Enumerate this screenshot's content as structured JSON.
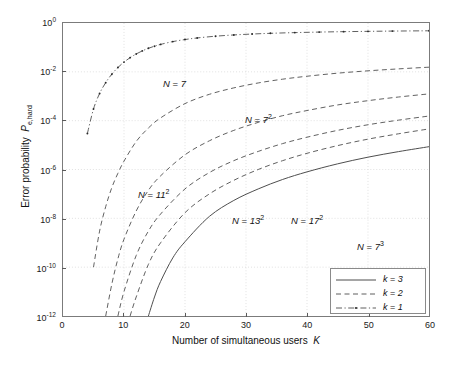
{
  "chart_data": {
    "type": "line",
    "title": "",
    "xlabel": "Number of simultaneous users  K",
    "ylabel": "Error probability  P e,hard",
    "xlim": [
      0,
      60
    ],
    "ylim": [
      1e-12,
      1
    ],
    "yscale": "log",
    "xscale": "linear",
    "grid": true,
    "xticks": [
      0,
      10,
      20,
      30,
      40,
      50,
      60
    ],
    "xtick_labels": [
      "0",
      "10",
      "20",
      "30",
      "40",
      "50",
      "60"
    ],
    "ytick_exponents": [
      0,
      -2,
      -4,
      -6,
      -8,
      -10,
      -12
    ],
    "ytick_labels": [
      "10^0",
      "10^-2",
      "10^-4",
      "10^-6",
      "10^-8",
      "10^-10",
      "10^-12"
    ],
    "legend_position": "lower right",
    "series": [
      {
        "name": "k = 1",
        "annotation": "N = 7",
        "style": "dashdot-marker",
        "x": [
          4,
          5,
          6,
          7,
          8,
          9,
          10,
          11,
          12,
          13,
          14,
          15,
          16,
          18,
          20,
          22,
          25,
          28,
          31,
          34,
          38,
          42,
          46,
          50,
          54,
          60
        ],
        "y": [
          3e-05,
          0.0003,
          0.0013,
          0.0036,
          0.008,
          0.015,
          0.025,
          0.038,
          0.054,
          0.072,
          0.092,
          0.112,
          0.133,
          0.173,
          0.21,
          0.244,
          0.288,
          0.324,
          0.353,
          0.378,
          0.404,
          0.425,
          0.442,
          0.455,
          0.467,
          0.48
        ]
      },
      {
        "name": "k = 2 (N = 7^2)",
        "annotation": "N = 7",
        "annotation_sup": "2",
        "style": "dashed",
        "x": [
          5,
          6,
          7,
          8,
          9,
          10,
          12,
          14,
          16,
          20,
          24,
          28,
          32,
          36,
          40,
          45,
          50,
          55,
          60
        ],
        "y": [
          1e-10,
          3e-09,
          3e-08,
          1.8e-07,
          7e-07,
          2.2e-06,
          1.4e-05,
          5e-05,
          0.00013,
          0.0005,
          0.0012,
          0.0022,
          0.0035,
          0.005,
          0.0066,
          0.0088,
          0.011,
          0.0132,
          0.0155
        ]
      },
      {
        "name": "k = 2 (N = 11^2)",
        "annotation": "N = 11",
        "annotation_sup": "2",
        "style": "dashed",
        "x": [
          7,
          8,
          9,
          10,
          12,
          14,
          16,
          20,
          24,
          28,
          32,
          36,
          40,
          45,
          50,
          55,
          60
        ],
        "y": [
          1e-12,
          2e-11,
          2.2e-10,
          1.4e-09,
          2e-08,
          1.4e-07,
          5.5e-07,
          4e-06,
          1.5e-05,
          4e-05,
          8.5e-05,
          0.00016,
          0.00026,
          0.00044,
          0.00066,
          0.00093,
          0.00125
        ]
      },
      {
        "name": "k = 2 (N = 13^2)",
        "annotation": "N = 13",
        "annotation_sup": "2",
        "style": "dashed",
        "x": [
          9,
          10,
          12,
          14,
          16,
          20,
          24,
          28,
          32,
          36,
          40,
          45,
          50,
          55,
          60
        ],
        "y": [
          1e-12,
          1e-11,
          3e-10,
          3e-09,
          1.5e-08,
          1.6e-07,
          7.5e-07,
          2.3e-06,
          5.5e-06,
          1.15e-05,
          2.1e-05,
          4e-05,
          6.8e-05,
          0.000105,
          0.000155
        ]
      },
      {
        "name": "k = 2 (N = 17^2)",
        "annotation": "N = 17",
        "annotation_sup": "2",
        "style": "dashed",
        "x": [
          11,
          12,
          14,
          16,
          20,
          24,
          28,
          32,
          36,
          40,
          45,
          50,
          55,
          60
        ],
        "y": [
          1e-12,
          6e-12,
          1.3e-10,
          1e-09,
          1.7e-08,
          1e-07,
          3.6e-07,
          1e-06,
          2.3e-06,
          4.6e-06,
          9.5e-06,
          1.75e-05,
          2.9e-05,
          4.6e-05
        ]
      },
      {
        "name": "k = 3 (N = 7^3)",
        "annotation": "N = 7",
        "annotation_sup": "3",
        "style": "solid",
        "x": [
          14,
          15,
          16,
          18,
          20,
          24,
          28,
          32,
          36,
          40,
          45,
          50,
          55,
          60
        ],
        "y": [
          1e-12,
          6e-12,
          2.6e-11,
          2.4e-10,
          1.1e-09,
          1.2e-08,
          5.4e-08,
          1.6e-07,
          3.9e-07,
          8e-07,
          1.7e-06,
          3.2e-06,
          5.4e-06,
          8.6e-06
        ]
      }
    ],
    "annotations": [
      {
        "text": "N = 7",
        "sup": "",
        "x_px": 163,
        "y_px": 78
      },
      {
        "text": "N = 7",
        "sup": "2",
        "x_px": 245,
        "y_px": 113
      },
      {
        "text": "N = 11",
        "sup": "2",
        "x_px": 138,
        "y_px": 188
      },
      {
        "text": "N = 13",
        "sup": "2",
        "x_px": 232,
        "y_px": 214
      },
      {
        "text": "N = 17",
        "sup": "2",
        "x_px": 291,
        "y_px": 214
      },
      {
        "text": "N = 7",
        "sup": "3",
        "x_px": 357,
        "y_px": 240
      }
    ],
    "legend_entries": [
      {
        "label": "k = 3",
        "style": "solid"
      },
      {
        "label": "k = 2",
        "style": "dashed"
      },
      {
        "label": "k = 1",
        "style": "dashdot-marker"
      }
    ],
    "colors": {
      "line": "#4d4d4d",
      "axis": "#7b7b7b",
      "grid": "#d9d9d9",
      "text": "#111111"
    }
  }
}
